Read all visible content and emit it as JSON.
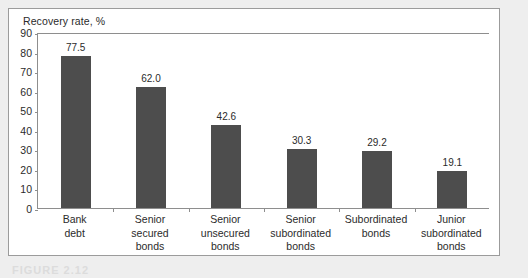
{
  "figure": {
    "caption": "FIGURE 2.12",
    "panel_border_color": "#9b9b9b",
    "page_background": "#eeeeee",
    "panel_background": "#ffffff"
  },
  "chart_data": {
    "type": "bar",
    "title": "Recovery rate, %",
    "xlabel": "",
    "ylabel": "Recovery rate, %",
    "ylim": [
      0,
      90
    ],
    "yticks": [
      0,
      10,
      20,
      30,
      40,
      50,
      60,
      70,
      80,
      90
    ],
    "ytick_labels": [
      "0",
      "10",
      "20",
      "30",
      "40",
      "50",
      "60",
      "70",
      "80",
      "90"
    ],
    "grid": false,
    "legend": false,
    "bar_color": "#4d4d4d",
    "axis_color": "#8e8e8e",
    "text_color": "#2b2b2b",
    "categories": [
      "Bank debt",
      "Senior secured bonds",
      "Senior unsecured bonds",
      "Senior subordinated bonds",
      "Subordinated bonds",
      "Junior subordinated bonds"
    ],
    "category_lines": [
      [
        "Bank",
        "debt"
      ],
      [
        "Senior",
        "secured",
        "bonds"
      ],
      [
        "Senior",
        "unsecured",
        "bonds"
      ],
      [
        "Senior",
        "subordinated",
        "bonds"
      ],
      [
        "Subordinated",
        "bonds"
      ],
      [
        "Junior",
        "subordinated",
        "bonds"
      ]
    ],
    "values": [
      77.5,
      62.0,
      42.6,
      30.3,
      29.2,
      19.1
    ],
    "value_labels": [
      "77.5",
      "62.0",
      "42.6",
      "30.3",
      "29.2",
      "19.1"
    ]
  }
}
